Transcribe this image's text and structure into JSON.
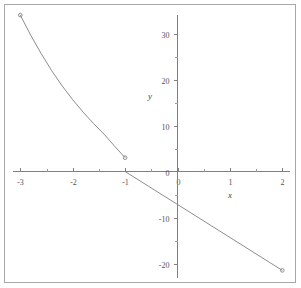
{
  "chart_data": {
    "type": "line",
    "title": "",
    "xlabel": "x",
    "ylabel": "y",
    "xlim": [
      -3,
      2
    ],
    "ylim": [
      -23,
      35
    ],
    "grid": false,
    "legend": "none",
    "x_ticks": [
      -3,
      -2,
      -1,
      0,
      1,
      2
    ],
    "x_tick_labels": [
      "-3",
      "-2",
      "-1",
      "0",
      "1",
      "2"
    ],
    "x_minor_ticks": [
      -2.5,
      -1.5,
      -0.5,
      0.5,
      1.5
    ],
    "y_ticks": [
      30,
      20,
      10,
      0,
      -10,
      -20
    ],
    "y_tick_labels": [
      "30",
      "20",
      "10",
      "0",
      "-10",
      "-20"
    ],
    "y_minor_ticks": [
      25,
      15,
      5,
      -5,
      -15
    ],
    "series": [
      {
        "name": "curve-branch",
        "style": "convex-decreasing",
        "endpoint_markers": [
          "open-circle",
          "open-circle"
        ],
        "x": [
          -3.0,
          -2.8,
          -2.6,
          -2.4,
          -2.2,
          -2.0,
          -1.8,
          -1.6,
          -1.4,
          -1.2,
          -1.0
        ],
        "y": [
          34.0,
          29.6,
          25.6,
          21.9,
          18.6,
          15.6,
          12.9,
          10.4,
          8.1,
          5.5,
          3.0
        ]
      },
      {
        "name": "line-branch",
        "style": "straight",
        "endpoint_markers": [
          "none",
          "filled-dot"
        ],
        "x": [
          -1.0,
          2.0
        ],
        "y": [
          0.0,
          -21.5
        ]
      }
    ]
  },
  "axis_labels": {
    "x": "x",
    "y": "y"
  },
  "colors": {
    "curve": "#8d8d8d",
    "axis": "#808080",
    "tick_text": "#555555",
    "frame": "#a8a8a8",
    "background": "#ffffff"
  }
}
